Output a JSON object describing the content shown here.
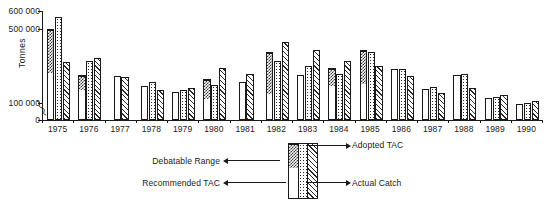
{
  "chart_data": {
    "type": "bar",
    "title": "",
    "xlabel": "",
    "ylabel": "Tonnes",
    "ylim": [
      0,
      600000
    ],
    "grid": false,
    "axis_break": true,
    "yticks": [
      "0",
      "100 000",
      "500 000",
      "600 000"
    ],
    "ytick_values": [
      0,
      100000,
      500000,
      600000
    ],
    "categories": [
      "1975",
      "1976",
      "1977",
      "1978",
      "1979",
      "1980",
      "1981",
      "1982",
      "1983",
      "1984",
      "1985",
      "1986",
      "1987",
      "1988",
      "1989",
      "1990"
    ],
    "legend_position": "below",
    "series": [
      {
        "name": "Recommended TAC",
        "pattern": "white",
        "values": [
          270000,
          175000,
          245000,
          195000,
          160000,
          125000,
          215000,
          155000,
          250000,
          200000,
          210000,
          285000,
          175000,
          250000,
          125000,
          95000
        ]
      },
      {
        "name": "Debatable Range",
        "pattern": "checkered",
        "note": "upper stacked segment; value is the top of the debatable range",
        "values": [
          500000,
          250000,
          null,
          null,
          null,
          230000,
          null,
          375000,
          null,
          290000,
          390000,
          null,
          null,
          null,
          null,
          null
        ]
      },
      {
        "name": "Adopted TAC",
        "pattern": "dotted",
        "values": [
          565000,
          330000,
          null,
          215000,
          170000,
          200000,
          null,
          330000,
          300000,
          260000,
          375000,
          285000,
          185000,
          255000,
          130000,
          100000
        ]
      },
      {
        "name": "Actual Catch",
        "pattern": "hatched",
        "values": [
          325000,
          345000,
          240000,
          170000,
          180000,
          290000,
          255000,
          430000,
          390000,
          330000,
          300000,
          245000,
          155000,
          180000,
          145000,
          110000
        ]
      }
    ]
  },
  "legend": {
    "items": [
      {
        "label": "Debatable Range",
        "pattern": "checkered",
        "side": "left"
      },
      {
        "label": "Recommended TAC",
        "pattern": "white",
        "side": "left"
      },
      {
        "label": "Adopted TAC",
        "pattern": "dotted",
        "side": "right"
      },
      {
        "label": "Actual Catch",
        "pattern": "hatched",
        "side": "right"
      }
    ]
  }
}
